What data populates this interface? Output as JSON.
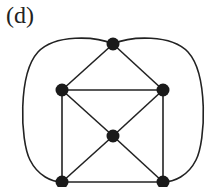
{
  "figure": {
    "label": "(d)",
    "colors": {
      "edge": "#222222",
      "node": "#1a1a1a",
      "background": "#ffffff"
    },
    "nodes": [
      {
        "id": "top",
        "x": 113,
        "y": 44
      },
      {
        "id": "left",
        "x": 62,
        "y": 90
      },
      {
        "id": "right",
        "x": 163,
        "y": 90
      },
      {
        "id": "center",
        "x": 113,
        "y": 136
      },
      {
        "id": "bottom-left",
        "x": 62,
        "y": 182
      },
      {
        "id": "bottom-right",
        "x": 163,
        "y": 182
      }
    ],
    "edges": [
      {
        "from": "top",
        "to": "left",
        "type": "straight"
      },
      {
        "from": "top",
        "to": "right",
        "type": "straight"
      },
      {
        "from": "left",
        "to": "right",
        "type": "straight"
      },
      {
        "from": "left",
        "to": "center",
        "type": "straight"
      },
      {
        "from": "right",
        "to": "center",
        "type": "straight"
      },
      {
        "from": "left",
        "to": "bottom-left",
        "type": "straight"
      },
      {
        "from": "right",
        "to": "bottom-right",
        "type": "straight"
      },
      {
        "from": "center",
        "to": "bottom-left",
        "type": "straight"
      },
      {
        "from": "center",
        "to": "bottom-right",
        "type": "straight"
      },
      {
        "from": "bottom-left",
        "to": "bottom-right",
        "type": "straight"
      },
      {
        "from": "top",
        "to": "bottom-left",
        "type": "curve-left"
      },
      {
        "from": "top",
        "to": "bottom-right",
        "type": "curve-right"
      }
    ]
  }
}
